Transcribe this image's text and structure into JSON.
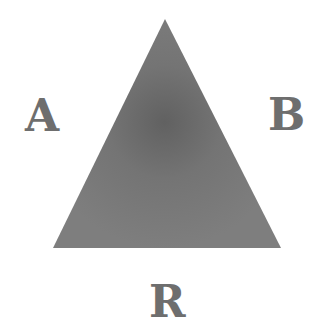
{
  "diagram": {
    "shape": "triangle",
    "vertices": [
      [
        165,
        19
      ],
      [
        53,
        248
      ],
      [
        281,
        248
      ]
    ],
    "colors": {
      "fill": "#7a7a7a",
      "center": "#616161",
      "label": "#6e6e6e",
      "background": "#ffffff"
    },
    "labels": {
      "left": "A",
      "right": "B",
      "bottom": "R"
    }
  }
}
